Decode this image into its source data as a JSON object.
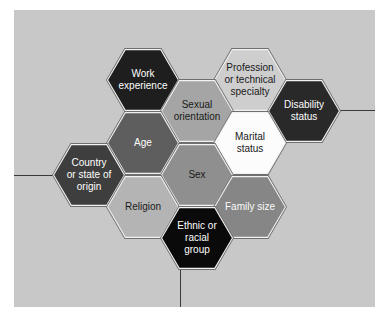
{
  "figure": {
    "page_background": "#ffffff",
    "panel_background": "#c8c8c8",
    "hex_outline_color": "#6f6f6f",
    "hex_gap_color": "#f2f2f2",
    "connector_color": "#3a3a3a",
    "hexagons": [
      {
        "id": "work-experience",
        "label": "Work\nexperience",
        "fill": "#1e1e1e",
        "text_color": "#ffffff",
        "cx": 143,
        "cy": 80
      },
      {
        "id": "profession-or-technical-specialty",
        "label": "Profession\nor technical\nspecialty",
        "fill": "#cecece",
        "text_color": "#1a1a1a",
        "cx": 250,
        "cy": 80
      },
      {
        "id": "sexual-orientation",
        "label": "Sexual\norientation",
        "fill": "#a5a5a5",
        "text_color": "#1a1a1a",
        "cx": 197,
        "cy": 111
      },
      {
        "id": "disability-status",
        "label": "Disability\nstatus",
        "fill": "#292929",
        "text_color": "#ffffff",
        "cx": 304,
        "cy": 111
      },
      {
        "id": "age",
        "label": "Age",
        "fill": "#5e5e5e",
        "text_color": "#ffffff",
        "cx": 143,
        "cy": 143
      },
      {
        "id": "marital-status",
        "label": "Marital\nstatus",
        "fill": "#fcfcfc",
        "text_color": "#1a1a1a",
        "cx": 250,
        "cy": 143
      },
      {
        "id": "country-or-state-of-origin",
        "label": "Country\nor state of\norigin",
        "fill": "#3e3e3e",
        "text_color": "#ffffff",
        "cx": 89,
        "cy": 175
      },
      {
        "id": "sex",
        "label": "Sex",
        "fill": "#8f8f8f",
        "text_color": "#1a1a1a",
        "cx": 197,
        "cy": 175
      },
      {
        "id": "religion",
        "label": "Religion",
        "fill": "#b4b4b4",
        "text_color": "#1a1a1a",
        "cx": 143,
        "cy": 207
      },
      {
        "id": "family-size",
        "label": "Family size",
        "fill": "#868686",
        "text_color": "#fafafa",
        "cx": 250,
        "cy": 207
      },
      {
        "id": "ethnic-or-racial-group",
        "label": "Ethnic or\nracial\ngroup",
        "fill": "#0a0a0a",
        "text_color": "#ffffff",
        "cx": 197,
        "cy": 238
      }
    ],
    "connectors": [
      {
        "id": "left-line",
        "orientation": "h",
        "x": 14,
        "y": 175,
        "length": 39
      },
      {
        "id": "right-line",
        "orientation": "h",
        "x": 340,
        "y": 110,
        "length": 35
      },
      {
        "id": "bottom-line",
        "orientation": "v",
        "x": 180,
        "y": 268,
        "length": 39
      }
    ]
  }
}
